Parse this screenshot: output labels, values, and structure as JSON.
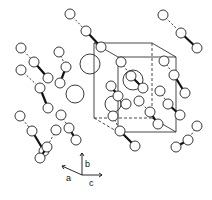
{
  "figure": {
    "type": "crystal-structure-unit-cell",
    "background": "#ffffff",
    "stroke": "#222222",
    "axes": {
      "labels": {
        "a": "a",
        "b": "b",
        "c": "c"
      },
      "origin": [
        82,
        175
      ],
      "a_tip": [
        62,
        166
      ],
      "b_tip": [
        82,
        153
      ],
      "c_tip": [
        102,
        175
      ]
    },
    "unit_cell": {
      "front": [
        [
          118,
          57
        ],
        [
          176,
          57
        ],
        [
          176,
          132
        ],
        [
          118,
          132
        ]
      ],
      "back": [
        [
          94,
          43
        ],
        [
          152,
          43
        ],
        [
          152,
          118
        ],
        [
          94,
          118
        ]
      ]
    },
    "large_atoms": [
      {
        "cx": 90,
        "cy": 64,
        "r": 10
      },
      {
        "cx": 133,
        "cy": 80,
        "r": 10
      },
      {
        "cx": 75,
        "cy": 94,
        "r": 9
      },
      {
        "cx": 113,
        "cy": 104,
        "r": 8
      }
    ],
    "molecules": [
      {
        "atoms": [
          [
            70,
            14
          ],
          [
            86,
            31
          ],
          [
            101,
            47
          ]
        ]
      },
      {
        "atoms": [
          [
            163,
            15
          ],
          [
            181,
            33
          ],
          [
            197,
            48
          ]
        ]
      },
      {
        "atoms": [
          [
            21,
            48
          ],
          [
            34,
            62
          ],
          [
            48,
            78
          ]
        ]
      },
      {
        "atoms": [
          [
            21,
            70
          ],
          [
            40,
            88
          ],
          [
            48,
            108
          ]
        ]
      },
      {
        "atoms": [
          [
            20,
            116
          ],
          [
            32,
            131
          ],
          [
            44,
            151
          ]
        ]
      },
      {
        "atoms": [
          [
            59,
            52
          ],
          [
            66,
            67
          ],
          [
            60,
            83
          ]
        ]
      },
      {
        "atoms": [
          [
            121,
            62
          ],
          [
            131,
            76
          ],
          [
            143,
            88
          ]
        ]
      },
      {
        "atoms": [
          [
            164,
            61
          ],
          [
            174,
            75
          ],
          [
            185,
            93
          ]
        ]
      },
      {
        "atoms": [
          [
            160,
            91
          ],
          [
            168,
            104
          ],
          [
            180,
            115
          ]
        ]
      },
      {
        "atoms": [
          [
            139,
            101
          ],
          [
            150,
            112
          ],
          [
            158,
            124
          ]
        ]
      },
      {
        "atoms": [
          [
            113,
            116
          ],
          [
            120,
            131
          ],
          [
            135,
            146
          ]
        ]
      },
      {
        "atoms": [
          [
            197,
            126
          ],
          [
            188,
            140
          ],
          [
            176,
            147
          ]
        ]
      },
      {
        "atoms": [
          [
            61,
            115
          ],
          [
            69,
            128
          ],
          [
            76,
            140
          ]
        ]
      },
      {
        "atoms": [
          [
            56,
            130
          ],
          [
            47,
            147
          ],
          [
            40,
            158
          ]
        ]
      },
      {
        "atoms": [
          [
            126,
            104
          ],
          [
            118,
            96
          ],
          [
            111,
            86
          ]
        ]
      }
    ]
  }
}
